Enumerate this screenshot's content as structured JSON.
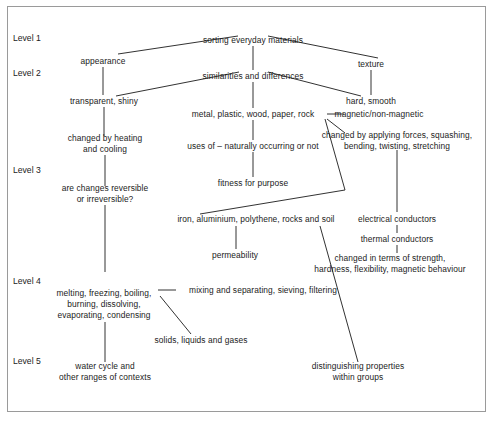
{
  "diagram": {
    "title_text": "sorting everyday materials",
    "type": "hierarchical-concept-map",
    "background_color": "#ffffff",
    "line_color": "#1b1b1b",
    "border_color": "#9a9a9a",
    "level_labels": [
      {
        "id": "level-1",
        "text": "Level 1",
        "x": 13,
        "y": 38
      },
      {
        "id": "level-2",
        "text": "Level 2",
        "x": 13,
        "y": 73
      },
      {
        "id": "level-3",
        "text": "Level 3",
        "x": 13,
        "y": 170
      },
      {
        "id": "level-4",
        "text": "Level 4",
        "x": 13,
        "y": 281
      },
      {
        "id": "level-5",
        "text": "Level 5",
        "x": 13,
        "y": 361
      }
    ],
    "nodes": [
      {
        "id": "sorting-everyday-materials",
        "text": "sorting everyday materials",
        "x": 253,
        "y": 40,
        "level": 1
      },
      {
        "id": "appearance",
        "text": "appearance",
        "x": 103,
        "y": 61,
        "level": 2
      },
      {
        "id": "texture",
        "text": "texture",
        "x": 371,
        "y": 64,
        "level": 2
      },
      {
        "id": "similarities-and-differences",
        "text": "similarities and differences",
        "x": 253,
        "y": 76,
        "level": 2
      },
      {
        "id": "transparent-shiny",
        "text": "transparent, shiny",
        "x": 104,
        "y": 101,
        "level": 2
      },
      {
        "id": "hard-smooth",
        "text": "hard, smooth",
        "x": 371,
        "y": 101,
        "level": 2
      },
      {
        "id": "metal-plastic-wood-paper-rock",
        "text": "metal, plastic, wood, paper, rock",
        "x": 253,
        "y": 114,
        "level": 2
      },
      {
        "id": "magnetic-non-magnetic",
        "text": "magnetic/non-magnetic",
        "x": 379,
        "y": 114,
        "level": 2
      },
      {
        "id": "changed-by-heating-and-cooling",
        "text": "changed by heating\nand cooling",
        "x": 105,
        "y": 144,
        "level": 3
      },
      {
        "id": "changed-by-applying-forces",
        "text": "changed by applying forces, squashing,\nbending, twisting, stretching",
        "x": 397,
        "y": 141,
        "level": 3
      },
      {
        "id": "uses-of-naturally-occurring-or-not",
        "text": "uses of – naturally occurring or not",
        "x": 253,
        "y": 146,
        "level": 3
      },
      {
        "id": "are-changes-reversible-or-irreversible",
        "text": "are changes reversible\nor irreversible?",
        "x": 105,
        "y": 194,
        "level": 3
      },
      {
        "id": "fitness-for-purpose",
        "text": "fitness for purpose",
        "x": 253,
        "y": 183,
        "level": 3
      },
      {
        "id": "iron-aluminium-polythene-rocks-soil",
        "text": "iron, aluminium, polythene, rocks and soil",
        "x": 256,
        "y": 219,
        "level": 3
      },
      {
        "id": "electrical-conductors",
        "text": "electrical conductors",
        "x": 397,
        "y": 219,
        "level": 3
      },
      {
        "id": "thermal-conductors",
        "text": "thermal conductors",
        "x": 397,
        "y": 239,
        "level": 3
      },
      {
        "id": "permeability",
        "text": "permeability",
        "x": 235,
        "y": 255,
        "level": 3
      },
      {
        "id": "changed-in-terms-of-strength",
        "text": "changed in terms of strength,\nhardness, flexibility, magnetic behaviour",
        "x": 390,
        "y": 264,
        "level": 3
      },
      {
        "id": "melting-freezing-boiling",
        "text": "melting, freezing, boiling,\nburning, dissolving,\nevaporating, condensing",
        "x": 104,
        "y": 304,
        "level": 4
      },
      {
        "id": "mixing-and-separating-sieving-filtering",
        "text": "mixing and separating, sieving, filtering",
        "x": 263,
        "y": 290,
        "level": 4
      },
      {
        "id": "solids-liquids-and-gases",
        "text": "solids, liquids and gases",
        "x": 201,
        "y": 340,
        "level": 4
      },
      {
        "id": "water-cycle-and-other-ranges-of-contexts",
        "text": "water cycle and\nother ranges of contexts",
        "x": 105,
        "y": 372,
        "level": 5
      },
      {
        "id": "distinguishing-properties-within-groups",
        "text": "distinguishing properties\nwithin groups",
        "x": 358,
        "y": 372,
        "level": 5
      }
    ],
    "edges": [
      {
        "id": "edge-sorting-to-appearance",
        "points": "118,54 238,36"
      },
      {
        "id": "edge-sorting-to-texture",
        "points": "268,36 378,58"
      },
      {
        "id": "edge-sorting-to-similarities",
        "points": "253,46 253,70"
      },
      {
        "id": "edge-appearance-to-transparent",
        "points": "103,67 103,95"
      },
      {
        "id": "edge-texture-to-hard-smooth",
        "points": "371,70 371,95"
      },
      {
        "id": "edge-similarities-to-transparent",
        "points": "116,96 239,72"
      },
      {
        "id": "edge-similarities-to-hard-smooth",
        "points": "268,72 361,96"
      },
      {
        "id": "edge-similarities-to-metal",
        "points": "253,82 253,108"
      },
      {
        "id": "edge-metal-to-magnetic",
        "points": "327,114 344,114"
      },
      {
        "id": "edge-metal-to-vertex",
        "points": "325,119 345,190"
      },
      {
        "id": "edge-vertex-to-iron",
        "points": "345,190 200,214"
      },
      {
        "id": "edge-metal-to-changed-forces",
        "points": "327,119 345,133"
      },
      {
        "id": "edge-metal-to-uses",
        "points": "253,120 253,140"
      },
      {
        "id": "edge-uses-to-fitness",
        "points": "253,152 253,177"
      },
      {
        "id": "edge-transparent-to-changed-heating",
        "points": "104,107 104,136"
      },
      {
        "id": "edge-changed-heating-to-reversible",
        "points": "105,155 105,186"
      },
      {
        "id": "edge-reversible-to-melting",
        "points": "105,205 105,272"
      },
      {
        "id": "edge-changed-forces-to-electrical",
        "points": "397,150 397,212"
      },
      {
        "id": "edge-electrical-to-thermal",
        "points": "397,225 397,233"
      },
      {
        "id": "edge-thermal-to-changed-terms",
        "points": "397,245 397,253"
      },
      {
        "id": "edge-iron-to-permeability",
        "points": "236,226 236,249"
      },
      {
        "id": "edge-iron-to-distinguishing",
        "points": "320,226 358,362"
      },
      {
        "id": "edge-melting-to-mixing",
        "points": "158,290 176,290"
      },
      {
        "id": "edge-melting-to-solids",
        "points": "160,296 191,334"
      },
      {
        "id": "edge-melting-to-water-cycle",
        "points": "105,322 105,362"
      }
    ]
  }
}
